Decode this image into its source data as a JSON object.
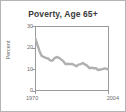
{
  "chart_data": {
    "type": "line",
    "title": "Poverty, Age 65+",
    "xlabel": "",
    "ylabel": "Percent",
    "xlim": [
      1970,
      2004
    ],
    "ylim": [
      0,
      30
    ],
    "ytick_labels": [
      "30",
      "20",
      "10",
      "0"
    ],
    "ytick_values": [
      30,
      20,
      10,
      0
    ],
    "xtick_labels": [
      "1970",
      "2004"
    ],
    "xtick_values": [
      1970,
      2004
    ],
    "grid": false,
    "legend": "none",
    "line_color": "#b0b0b0",
    "series": [
      {
        "name": "Poverty rate, age 65+",
        "x": [
          1970,
          1971,
          1972,
          1973,
          1974,
          1975,
          1976,
          1977,
          1978,
          1979,
          1980,
          1981,
          1982,
          1983,
          1984,
          1985,
          1986,
          1987,
          1988,
          1989,
          1990,
          1991,
          1992,
          1993,
          1994,
          1995,
          1996,
          1997,
          1998,
          1999,
          2000,
          2001,
          2002,
          2003,
          2004
        ],
        "values": [
          24.6,
          21.6,
          18.6,
          16.3,
          15.7,
          15.3,
          15.0,
          14.1,
          14.0,
          15.2,
          15.7,
          15.3,
          14.6,
          13.8,
          12.4,
          12.6,
          12.4,
          12.5,
          12.0,
          11.4,
          12.2,
          12.4,
          12.9,
          12.2,
          11.7,
          10.5,
          10.8,
          10.5,
          10.5,
          9.7,
          9.9,
          10.1,
          10.4,
          10.2,
          9.8
        ]
      }
    ]
  }
}
